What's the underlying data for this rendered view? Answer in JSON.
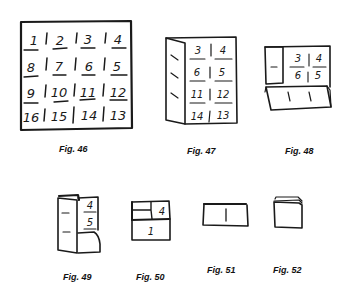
{
  "figures": [
    {
      "id": "fig46",
      "caption": "Fig. 46",
      "description": "4x4 grid of numbered squares (unfolded sheet)",
      "grid": [
        [
          "1",
          "2",
          "3",
          "4"
        ],
        [
          "8",
          "7",
          "6",
          "5"
        ],
        [
          "9",
          "10",
          "11",
          "12"
        ],
        [
          "16",
          "15",
          "14",
          "13"
        ]
      ]
    },
    {
      "id": "fig47",
      "caption": "Fig. 47",
      "description": "Left column folded over; 2x4 visible",
      "grid": [
        [
          "3",
          "4"
        ],
        [
          "6",
          "5"
        ],
        [
          "11",
          "12"
        ],
        [
          "14",
          "13"
        ]
      ]
    },
    {
      "id": "fig48",
      "caption": "Fig. 48",
      "description": "Bottom half folded up",
      "grid": [
        [
          "3",
          "4"
        ],
        [
          "6",
          "5"
        ]
      ]
    },
    {
      "id": "fig49",
      "caption": "Fig. 49",
      "description": "Further fold, showing 4 and 5",
      "grid": [
        [
          "4"
        ],
        [
          "5"
        ]
      ]
    },
    {
      "id": "fig50",
      "caption": "Fig. 50",
      "description": "Folded packet showing 4 top-right and 1 on bottom flap",
      "labels": [
        "4",
        "1"
      ]
    },
    {
      "id": "fig51",
      "caption": "Fig. 51",
      "description": "Flat folded packet"
    },
    {
      "id": "fig52",
      "caption": "Fig. 52",
      "description": "Final folded stack"
    }
  ]
}
